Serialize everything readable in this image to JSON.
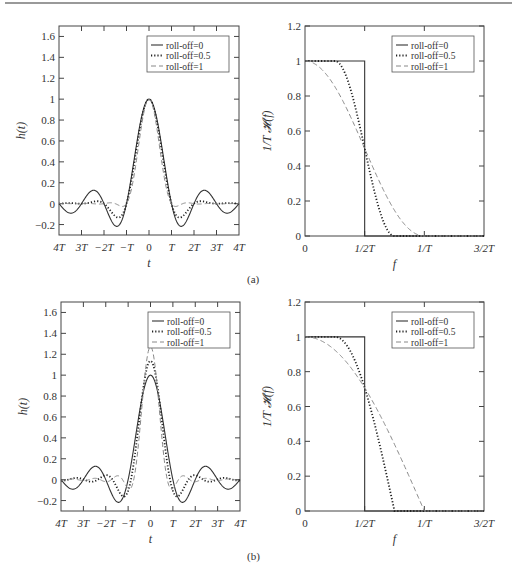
{
  "figure": {
    "panel_labels": [
      "(a)",
      "(b)"
    ]
  },
  "legend": [
    "roll-off=0",
    "roll-off=0.5",
    "roll-off=1"
  ],
  "chart_data": [
    {
      "id": "a-time",
      "type": "line",
      "panel": "(a)",
      "xlabel": "t",
      "ylabel": "h(t)",
      "xticks": [
        "4T",
        "3T",
        "−2T",
        "−T",
        "0",
        "T",
        "2T",
        "3T",
        "4T"
      ],
      "x_range": [
        -4,
        4
      ],
      "yticks": [
        "−0.2",
        "0",
        "0.2",
        "0.4",
        "0.6",
        "0.8",
        "1",
        "1.2",
        "1.4",
        "1.6"
      ],
      "ylim": [
        -0.3,
        1.7
      ],
      "legend_position": "upper right",
      "series": [
        {
          "name": "roll-off=0",
          "style": "solid",
          "peak": 1.0,
          "description": "sinc(t/T)"
        },
        {
          "name": "roll-off=0.5",
          "style": "dotted",
          "peak": 1.0,
          "description": "raised cosine, beta=0.5"
        },
        {
          "name": "roll-off=1",
          "style": "dashed",
          "peak": 1.0,
          "description": "raised cosine, beta=1"
        }
      ]
    },
    {
      "id": "a-freq",
      "type": "line",
      "panel": "(a)",
      "xlabel": "f",
      "ylabel": "1/T 𝓗(f)",
      "xticks": [
        "0",
        "1/2T",
        "1/T",
        "3/2T"
      ],
      "x_range": [
        0,
        1.5
      ],
      "yticks": [
        "0",
        "0.2",
        "0.4",
        "0.6",
        "0.8",
        "1",
        "1.2"
      ],
      "ylim": [
        0,
        1.2
      ],
      "legend_position": "upper right",
      "series": [
        {
          "name": "roll-off=0",
          "style": "solid",
          "points": [
            [
              0,
              1
            ],
            [
              0.5,
              1
            ],
            [
              0.5,
              0
            ],
            [
              1.5,
              0
            ]
          ]
        },
        {
          "name": "roll-off=0.5",
          "style": "dotted",
          "points": [
            [
              0,
              1
            ],
            [
              0.25,
              1
            ],
            [
              0.5,
              0.5
            ],
            [
              0.75,
              0
            ],
            [
              1.5,
              0
            ]
          ]
        },
        {
          "name": "roll-off=1",
          "style": "dashed",
          "points": [
            [
              0,
              1
            ],
            [
              0.5,
              0.5
            ],
            [
              1.0,
              0
            ],
            [
              1.5,
              0
            ]
          ]
        }
      ]
    },
    {
      "id": "b-time",
      "type": "line",
      "panel": "(b)",
      "xlabel": "t",
      "ylabel": "h(t)",
      "xticks": [
        "4T",
        "3T",
        "−2T",
        "−T",
        "0",
        "T",
        "2T",
        "3T",
        "4T"
      ],
      "x_range": [
        -4,
        4
      ],
      "yticks": [
        "−0.2",
        "0",
        "0.2",
        "0.4",
        "0.6",
        "0.8",
        "1",
        "1.2",
        "1.4",
        "1.6"
      ],
      "ylim": [
        -0.3,
        1.7
      ],
      "legend_position": "upper right",
      "series": [
        {
          "name": "roll-off=0",
          "style": "solid",
          "peak": 1.0
        },
        {
          "name": "roll-off=0.5",
          "style": "dotted",
          "peak": 1.13
        },
        {
          "name": "roll-off=1",
          "style": "dashed",
          "peak": 1.27
        }
      ]
    },
    {
      "id": "b-freq",
      "type": "line",
      "panel": "(b)",
      "xlabel": "f",
      "ylabel": "1/T 𝓗(f)",
      "xticks": [
        "0",
        "1/2T",
        "1/T",
        "3/2T"
      ],
      "x_range": [
        0,
        1.5
      ],
      "yticks": [
        "0",
        "0.2",
        "0.4",
        "0.6",
        "0.8",
        "1",
        "1.2"
      ],
      "ylim": [
        0,
        1.2
      ],
      "legend_position": "upper right",
      "series": [
        {
          "name": "roll-off=0",
          "style": "solid",
          "points": [
            [
              0,
              1
            ],
            [
              0.5,
              1
            ],
            [
              0.5,
              0
            ],
            [
              1.5,
              0
            ]
          ]
        },
        {
          "name": "roll-off=0.5",
          "style": "dotted",
          "points": [
            [
              0,
              1
            ],
            [
              0.25,
              1
            ],
            [
              0.5,
              0.707
            ],
            [
              0.75,
              0
            ],
            [
              1.5,
              0
            ]
          ]
        },
        {
          "name": "roll-off=1",
          "style": "dashed",
          "points": [
            [
              0,
              1
            ],
            [
              0.5,
              0.707
            ],
            [
              1.0,
              0
            ],
            [
              1.5,
              0
            ]
          ]
        }
      ]
    }
  ]
}
